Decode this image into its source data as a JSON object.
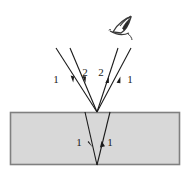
{
  "figure": {
    "type": "optics-ray-diagram",
    "title": "",
    "background_color": "#ffffff"
  },
  "medium": {
    "name": "film-slab",
    "fill_color": "#d8d8d8",
    "border_color": "#808080",
    "x": 10,
    "y": 112,
    "width": 170,
    "height": 53
  },
  "observer": {
    "name": "eye-icon",
    "label": "",
    "x": 122,
    "y": 27,
    "color": "#3a3a3a"
  },
  "rays": [
    {
      "id": "incident-left-outer",
      "label": "1",
      "label_x": 56,
      "label_y": 83,
      "x1": 56,
      "y1": 48,
      "x2": 97,
      "y2": 112,
      "arrow_at": 0.52,
      "arrow_direction": "down"
    },
    {
      "id": "incident-left-inner",
      "label": "2",
      "label_x": 85,
      "label_y": 76,
      "x1": 70,
      "y1": 48,
      "x2": 97,
      "y2": 112,
      "arrow_at": 0.52,
      "arrow_direction": "down"
    },
    {
      "id": "reflected-right-inner",
      "label": "2",
      "label_x": 101,
      "label_y": 76,
      "x1": 97,
      "y1": 112,
      "x2": 118,
      "y2": 48,
      "arrow_at": 0.56,
      "arrow_direction": "up"
    },
    {
      "id": "reflected-right-outer",
      "label": "1",
      "label_x": 130,
      "label_y": 83,
      "x1": 97,
      "y1": 112,
      "x2": 131,
      "y2": 48,
      "arrow_at": 0.56,
      "arrow_direction": "up"
    },
    {
      "id": "transmitted-down",
      "label": "1",
      "label_x": 79,
      "label_y": 146,
      "x1": 85,
      "y1": 112,
      "x2": 97,
      "y2": 165,
      "arrow_at": 0.58,
      "arrow_direction": "down"
    },
    {
      "id": "internal-reflected-up",
      "label": "1",
      "label_x": 110,
      "label_y": 146,
      "x1": 97,
      "y1": 165,
      "x2": 110,
      "y2": 112,
      "arrow_at": 0.62,
      "arrow_direction": "up"
    }
  ],
  "ray_color": "#1a1a1a",
  "labels": {
    "ray_1_top_left": "1",
    "ray_2_top_left": "2",
    "ray_2_top_right": "2",
    "ray_1_top_right": "1",
    "ray_1_inside_left": "1",
    "ray_1_inside_right": "1"
  }
}
